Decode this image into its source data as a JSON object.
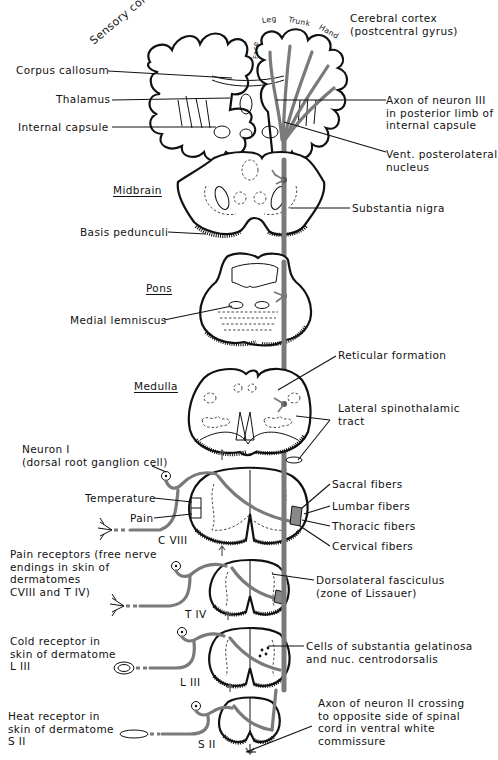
{
  "figure": {
    "sections": {
      "midbrain": "Midbrain",
      "pons": "Pons",
      "medulla": "Medulla"
    },
    "cortex_labels": {
      "sensory_cortex": "Sensory cortex",
      "leg": "Leg",
      "trunk": "Trunk",
      "hand": "Hand",
      "face": "Face"
    },
    "left_labels": {
      "corpus_callosum": "Corpus callosum",
      "thalamus": "Thalamus",
      "internal_capsule": "Internal capsule",
      "basis_pedunculi": "Basis pedunculi",
      "medial_lemniscus": "Medial lemniscus",
      "neuron_1": "Neuron I\n(dorsal root ganglion cell)",
      "temperature": "Temperature",
      "pain": "Pain",
      "pain_receptors": "Pain receptors (free nerve\nendings in skin of\ndermatomes\nCVIII and T IV)",
      "cold_receptor": "Cold receptor in\nskin of dermatome\nL III",
      "heat_receptor": "Heat receptor in\nskin of dermatome\nS II"
    },
    "right_labels": {
      "cerebral_cortex": "Cerebral cortex\n(postcentral gyrus)",
      "axon_neuron_3": "Axon of neuron III\nin posterior limb of\ninternal capsule",
      "vpl_nucleus": "Vent. posterolateral\nnucleus",
      "substantia_nigra": "Substantia nigra",
      "reticular_formation": "Reticular formation",
      "lateral_spinothalamic": "Lateral spinothalamic\ntract",
      "sacral_fibers": "Sacral fibers",
      "lumbar_fibers": "Lumbar fibers",
      "thoracic_fibers": "Thoracic fibers",
      "cervical_fibers": "Cervical fibers",
      "dorsolateral_fasciculus": "Dorsolateral fasciculus\n(zone of Lissauer)",
      "substantia_gelatinosa": "Cells of substantia gelatinosa\nand nuc. centrodorsalis",
      "axon_neuron_2": "Axon of neuron II crossing\nto opposite side of spinal\ncord in ventral white\ncommissure"
    },
    "segment_labels": {
      "c8": "C VIII",
      "t4": "T IV",
      "l3": "L III",
      "s2": "S II"
    },
    "colors": {
      "line": "#111111",
      "tract": "#7a7a7a",
      "background": "#ffffff"
    }
  }
}
